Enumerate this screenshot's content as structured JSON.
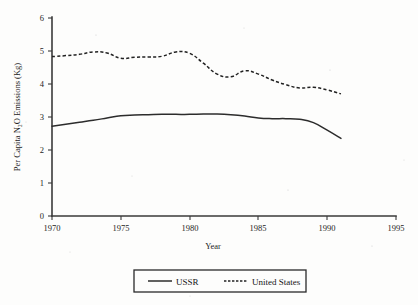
{
  "chart_data": {
    "type": "line",
    "title": "",
    "xlabel": "Year",
    "ylabel": "Per Capita N2O Emissions (Kg)",
    "ylabel_display": "Per Capita N₂O Emissions (Kg)",
    "xlim": [
      1970,
      1995
    ],
    "ylim": [
      0,
      6
    ],
    "xticks": [
      1970,
      1975,
      1980,
      1985,
      1990,
      1995
    ],
    "yticks": [
      0,
      1,
      2,
      3,
      4,
      5,
      6
    ],
    "grid": false,
    "legend_position": "below-center",
    "x": [
      1970,
      1971,
      1972,
      1973,
      1974,
      1975,
      1976,
      1977,
      1978,
      1979,
      1980,
      1981,
      1982,
      1983,
      1984,
      1985,
      1986,
      1987,
      1988,
      1989,
      1990,
      1991
    ],
    "series": [
      {
        "name": "USSR",
        "style": "solid",
        "color": "#2c2c2c",
        "values": [
          2.72,
          2.78,
          2.84,
          2.9,
          2.97,
          3.04,
          3.06,
          3.07,
          3.08,
          3.08,
          3.08,
          3.09,
          3.09,
          3.07,
          3.03,
          2.97,
          2.95,
          2.95,
          2.93,
          2.83,
          2.6,
          2.35
        ]
      },
      {
        "name": "United States",
        "style": "dashed",
        "color": "#222222",
        "values": [
          4.83,
          4.86,
          4.9,
          4.97,
          4.94,
          4.78,
          4.81,
          4.82,
          4.84,
          4.97,
          4.93,
          4.63,
          4.3,
          4.22,
          4.4,
          4.3,
          4.12,
          3.98,
          3.88,
          3.9,
          3.82,
          3.7
        ]
      }
    ]
  },
  "legend": {
    "items": [
      {
        "label": "USSR",
        "style": "solid"
      },
      {
        "label": "United States",
        "style": "dashed"
      }
    ]
  },
  "axes": {
    "x_tick_labels": [
      "1970",
      "1975",
      "1980",
      "1985",
      "1990",
      "1995"
    ],
    "y_tick_labels": [
      "0",
      "1",
      "2",
      "3",
      "4",
      "5",
      "6"
    ],
    "x_title": "Year",
    "y_title": "Per Capita N₂O Emissions (Kg)"
  }
}
